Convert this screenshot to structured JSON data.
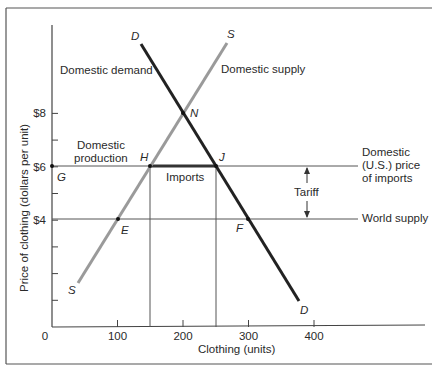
{
  "chart_data": {
    "type": "line",
    "title": "",
    "xlabel": "Clothing (units)",
    "ylabel": "Price of clothing (dollars per unit)",
    "xlim": [
      0,
      540
    ],
    "ylim": [
      0,
      11.3
    ],
    "x_ticks": [
      {
        "value": 0,
        "label": "0"
      },
      {
        "value": 100,
        "label": "100"
      },
      {
        "value": 200,
        "label": "200"
      },
      {
        "value": 300,
        "label": "300"
      },
      {
        "value": 400,
        "label": "400"
      }
    ],
    "y_ticks": [
      {
        "value": 1,
        "label": ""
      },
      {
        "value": 2,
        "label": ""
      },
      {
        "value": 3,
        "label": ""
      },
      {
        "value": 4,
        "label": "$4"
      },
      {
        "value": 5,
        "label": ""
      },
      {
        "value": 6,
        "label": "$6"
      },
      {
        "value": 7,
        "label": ""
      },
      {
        "value": 8,
        "label": "$8"
      }
    ],
    "grid": false,
    "series": [
      {
        "name": "Domestic demand",
        "curve_label": "D",
        "color": "#222222",
        "points": [
          [
            137,
            10.6
          ],
          [
            380,
            0.95
          ]
        ]
      },
      {
        "name": "Domestic supply",
        "curve_label": "S",
        "color": "#9a9a9a",
        "points": [
          [
            40,
            1.65
          ],
          [
            268,
            10.6
          ]
        ]
      },
      {
        "name": "Domestic (U.S.) price of imports",
        "color": "#444444",
        "points": [
          [
            0,
            6
          ],
          [
            470,
            6
          ]
        ]
      },
      {
        "name": "World supply",
        "color": "#444444",
        "points": [
          [
            0,
            4
          ],
          [
            470,
            4
          ]
        ]
      }
    ],
    "imports_segment": {
      "label": "Imports",
      "from": [
        150,
        6
      ],
      "to": [
        250,
        6
      ],
      "color": "#333333"
    },
    "vertical_guides": [
      150,
      250
    ],
    "tariff": {
      "label": "Tariff",
      "x": 400,
      "from": 4,
      "to": 6
    },
    "points": [
      {
        "name": "N",
        "x": 200,
        "y": 8
      },
      {
        "name": "H",
        "x": 150,
        "y": 6
      },
      {
        "name": "J",
        "x": 250,
        "y": 6
      },
      {
        "name": "G",
        "x": 0,
        "y": 6
      },
      {
        "name": "E",
        "x": 100,
        "y": 4
      },
      {
        "name": "F",
        "x": 300,
        "y": 4
      }
    ],
    "annotations": [
      "Domestic demand",
      "Domestic supply",
      "Domestic production",
      "Imports",
      "Domestic (U.S.) price of imports",
      "Tariff",
      "World supply"
    ]
  },
  "labels": {
    "domestic_demand": "Domestic demand",
    "domestic_supply": "Domestic supply",
    "domestic_production_1": "Domestic",
    "domestic_production_2": "production",
    "imports": "Imports",
    "price_imports_1": "Domestic",
    "price_imports_2": "(U.S.) price",
    "price_imports_3": "of imports",
    "tariff": "Tariff",
    "world_supply": "World supply",
    "d_top": "D",
    "d_bottom": "D",
    "s_top": "S",
    "s_bottom": "S",
    "n": "N",
    "h": "H",
    "j": "J",
    "g": "G",
    "e": "E",
    "f": "F",
    "xlabel": "Clothing (units)",
    "ylabel": "Price of clothing (dollars per unit)"
  }
}
